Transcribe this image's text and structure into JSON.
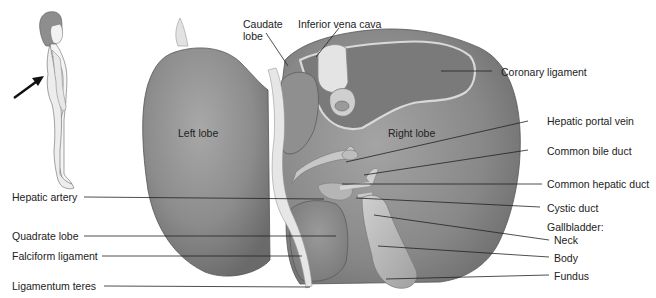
{
  "figure": {
    "orientation_figure": {
      "description": "standing human figure, side view with arrow pointing at posterior right side",
      "arrow_color": "#111111"
    },
    "colors": {
      "background": "#ffffff",
      "liver": "#8a8a8a",
      "liver_highlight": "#b0b0b0",
      "liver_shadow": "#5e5e5e",
      "ligament": "#e6e6e6",
      "vessel": "#c9c9c9",
      "gallbladder": "#b4b4b4",
      "leader_line": "#222222",
      "text": "#222222"
    },
    "internal_labels": {
      "left_lobe": "Left lobe",
      "right_lobe": "Right lobe"
    },
    "labels_top": {
      "caudate_lobe_line1": "Caudate",
      "caudate_lobe_line2": "lobe",
      "inferior_vena_cava": "Inferior vena cava"
    },
    "labels_left": {
      "hepatic_artery": "Hepatic artery",
      "quadrate_lobe": "Quadrate lobe",
      "falciform_ligament": "Falciform ligament",
      "ligamentum_teres": "Ligamentum teres"
    },
    "labels_right": {
      "coronary_ligament": "Coronary ligament",
      "hepatic_portal_vein": "Hepatic portal vein",
      "common_bile_duct": "Common bile duct",
      "common_hepatic_duct": "Common hepatic duct",
      "cystic_duct": "Cystic duct",
      "gallbladder": "Gallbladder:",
      "neck": "Neck",
      "body": "Body",
      "fundus": "Fundus"
    }
  }
}
